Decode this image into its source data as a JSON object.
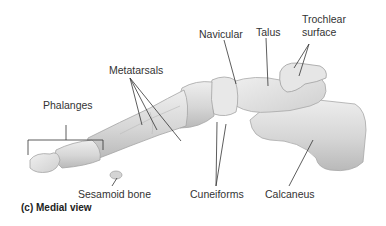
{
  "figure": {
    "caption": "(c) Medial view"
  },
  "labels": {
    "metatarsals": "Metatarsals",
    "phalanges": "Phalanges",
    "navicular": "Navicular",
    "talus": "Talus",
    "trochlear_line1": "Trochlear",
    "trochlear_line2": "surface",
    "sesamoid": "Sesamoid bone",
    "cuneiforms": "Cuneiforms",
    "calcaneus": "Calcaneus"
  },
  "colors": {
    "bone_fill": "#dcdcdc",
    "bone_light": "#ececec",
    "bone_shadow": "#b8b8b8",
    "bone_edge": "#9a9a9a",
    "leader_line": "#333333",
    "text": "#333333"
  }
}
